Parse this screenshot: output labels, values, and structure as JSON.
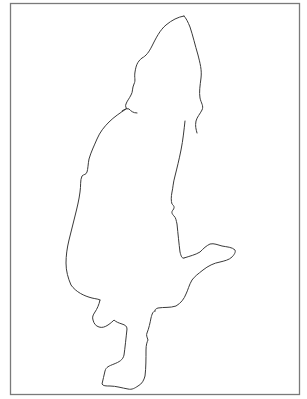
{
  "drawing": {
    "description": "Hand-drawn silhouette outline figure inside a rectangular frame",
    "colors": {
      "background": "#ffffff",
      "frame": "#7a7a7a",
      "stroke": "#3a3a3a"
    },
    "frame": {
      "x": 10,
      "y": 3,
      "width": 289,
      "height": 391
    }
  }
}
